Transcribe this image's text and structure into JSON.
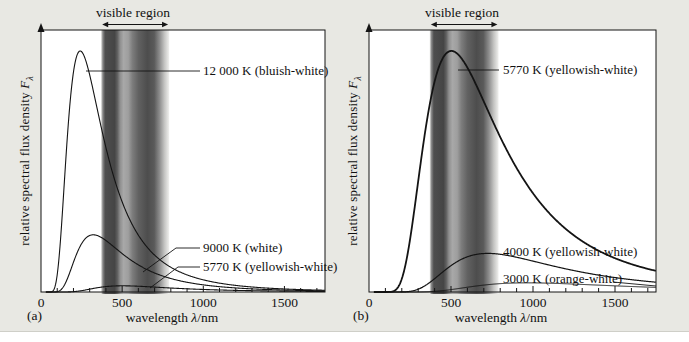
{
  "figure": {
    "background_color": "#e8e8e3",
    "plot_background": "#ffffff",
    "line_color": "#141414",
    "panel_letters": [
      "(a)",
      "(b)"
    ]
  },
  "annotations": {
    "visible_region": "visible region"
  },
  "axis_label_parts": {
    "x_prefix": "wavelength ",
    "x_symbol": "λ",
    "x_suffix": "/nm",
    "y_prefix": "relative spectral flux density ",
    "y_symbol": "F",
    "y_sub": "λ"
  },
  "chart_data": [
    {
      "id": "a",
      "type": "line",
      "xlabel": "wavelength λ/nm",
      "ylabel": "relative spectral flux density Fλ",
      "x_range_nm": [
        0,
        1750
      ],
      "x_ticks": [
        0,
        500,
        1000,
        1500
      ],
      "x_minor_tick_step_nm": 100,
      "grid": false,
      "visible_band_nm": [
        380,
        750
      ],
      "model": "Planck blackbody spectral flux density; peak heights scale as T^5; hottest curve normalized to 1",
      "series": [
        {
          "name": "12 000 K (bluish-white)",
          "temperature_K": 12000,
          "peak_wavelength_nm": 242,
          "relative_peak_height": 1.0,
          "stroke_width": 1.1
        },
        {
          "name": "9000 K (white)",
          "temperature_K": 9000,
          "peak_wavelength_nm": 322,
          "relative_peak_height": 0.237,
          "stroke_width": 1.1
        },
        {
          "name": "5770 K (yellowish-white)",
          "temperature_K": 5770,
          "peak_wavelength_nm": 502,
          "relative_peak_height": 0.026,
          "stroke_width": 1.1
        }
      ]
    },
    {
      "id": "b",
      "type": "line",
      "xlabel": "wavelength λ/nm",
      "ylabel": "relative spectral flux density Fλ",
      "x_range_nm": [
        0,
        1750
      ],
      "x_ticks": [
        0,
        500,
        1000,
        1500
      ],
      "x_minor_tick_step_nm": 100,
      "grid": false,
      "visible_band_nm": [
        380,
        750
      ],
      "model": "Planck blackbody spectral flux density; peak heights scale as T^5; hottest curve normalized to 1",
      "series": [
        {
          "name": "5770 K (yellowish-white)",
          "temperature_K": 5770,
          "peak_wavelength_nm": 502,
          "relative_peak_height": 1.0,
          "stroke_width": 1.8
        },
        {
          "name": "4000 K (yellowish-white)",
          "temperature_K": 4000,
          "peak_wavelength_nm": 724,
          "relative_peak_height": 0.16,
          "stroke_width": 1.2
        },
        {
          "name": "3000 K (orange-white)",
          "temperature_K": 3000,
          "peak_wavelength_nm": 966,
          "relative_peak_height": 0.038,
          "stroke_width": 1.0
        }
      ]
    }
  ]
}
